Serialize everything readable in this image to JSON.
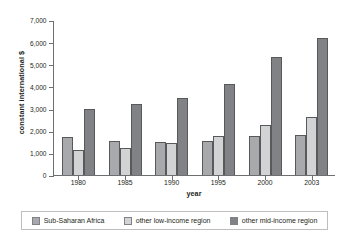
{
  "chart_data": {
    "type": "bar",
    "title": "",
    "subtitle": "",
    "xlabel": "year",
    "ylabel": "constant international $",
    "categories": [
      "1980",
      "1985",
      "1990",
      "1995",
      "2000",
      "2003"
    ],
    "series": [
      {
        "name": "Sub-Saharan Africa",
        "color": "#a7a9ac",
        "values": [
          1720,
          1530,
          1500,
          1530,
          1740,
          1820
        ]
      },
      {
        "name": "other low-income region",
        "color": "#d1d3d4",
        "values": [
          1140,
          1230,
          1450,
          1780,
          2250,
          2630
        ]
      },
      {
        "name": "other mid-income region",
        "color": "#808285",
        "values": [
          2990,
          3220,
          3460,
          4110,
          5320,
          6200
        ]
      }
    ],
    "ylim": [
      0,
      7000
    ],
    "yticks": [
      0,
      1000,
      2000,
      3000,
      4000,
      5000,
      6000,
      7000
    ],
    "ytick_labels": [
      "0",
      "1,000",
      "2,000",
      "3,000",
      "4,000",
      "5,000",
      "6,000",
      "7,000"
    ],
    "grid": false,
    "legend_position": "bottom"
  },
  "colors": {
    "axis": "#6d6e71",
    "text": "#231f20",
    "bar_outline": "#58595b",
    "legend_border": "#bcbec0"
  }
}
